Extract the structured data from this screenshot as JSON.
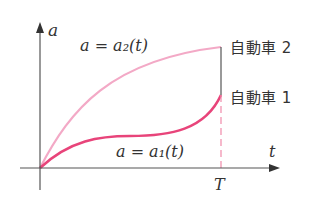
{
  "diagram": {
    "axes": {
      "y_label": "a",
      "x_label": "t",
      "x_tick_label": "T"
    },
    "curves": [
      {
        "name": "car2",
        "formula": "a = a₂(t)",
        "label": "自動車 2",
        "color": "#f0a0c0"
      },
      {
        "name": "car1",
        "formula": "a = a₁(t)",
        "label": "自動車 1",
        "color": "#e8447a"
      }
    ],
    "colors": {
      "axis": "#333333",
      "connector": "#555555",
      "dashed_T": "#f08aaa"
    }
  }
}
